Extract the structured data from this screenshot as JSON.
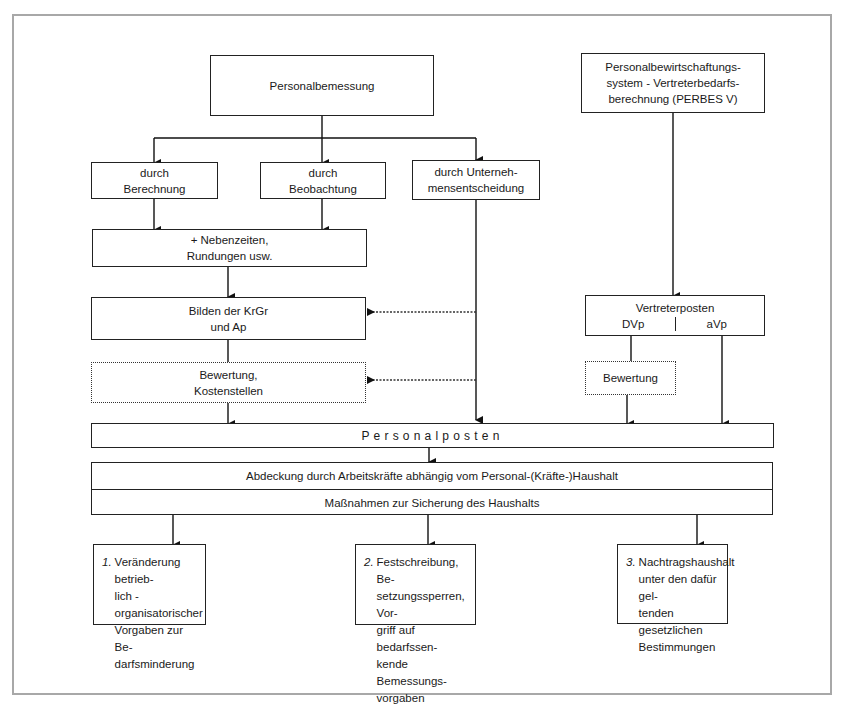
{
  "diagram": {
    "nodes": {
      "personalbemessung": "Personalbemessung",
      "perbes": "Personalbewirtschaftungs-\nsystem - Vertreterbedarfs-\nberechnung (PERBES V)",
      "berechnung": "durch\nBerechnung",
      "beobachtung": "durch\nBeobachtung",
      "unternehmensentscheidung": "durch Unterneh-\nmensentscheidung",
      "nebenzeiten": "+ Nebenzeiten,\nRundungen usw.",
      "bilden": "Bilden der KrGr\nund Ap",
      "bewertung_kosten": "Bewertung,\nKostenstellen",
      "vertreterposten": {
        "title": "Vertreterposten",
        "left": "DVp",
        "right": "aVp"
      },
      "bewertung_vp": "Bewertung",
      "personalposten": "Personalposten",
      "abdeckung": "Abdeckung durch Arbeitskräfte abhängig vom Personal-(Kräfte-)Haushalt",
      "massnahmen": "Maßnahmen zur Sicherung des Haushalts",
      "option1": {
        "num": "1.",
        "text": "Veränderung betrieb-\nlich - organisatorischer\nVorgaben zur Be-\ndarfsminderung"
      },
      "option2": {
        "num": "2.",
        "text": "Festschreibung, Be-\nsetzungssperren, Vor-\ngriff auf bedarfssen-\nkende Bemessungs-\nvorgaben"
      },
      "option3": {
        "num": "3.",
        "text": "Nachtragshaushalt\nunter den dafür gel-\ntenden gesetzlichen\nBestimmungen"
      }
    },
    "edges": [
      {
        "from": "Personalbemessung",
        "to": "durch Berechnung",
        "style": "solid-arrow"
      },
      {
        "from": "Personalbemessung",
        "to": "durch Beobachtung",
        "style": "solid-arrow"
      },
      {
        "from": "Personalbemessung",
        "to": "durch Unternehmensentscheidung",
        "style": "solid-arrow"
      },
      {
        "from": "durch Berechnung",
        "to": "+ Nebenzeiten, Rundungen usw.",
        "style": "solid-arrow"
      },
      {
        "from": "durch Beobachtung",
        "to": "+ Nebenzeiten, Rundungen usw.",
        "style": "solid-arrow"
      },
      {
        "from": "+ Nebenzeiten, Rundungen usw.",
        "to": "Bilden der KrGr und Ap",
        "style": "solid-arrow"
      },
      {
        "from": "Bilden der KrGr und Ap",
        "to": "Bewertung, Kostenstellen",
        "style": "solid-line"
      },
      {
        "from": "durch Unternehmensentscheidung",
        "to": "Bilden der KrGr und Ap",
        "style": "dotted-arrow"
      },
      {
        "from": "durch Unternehmensentscheidung",
        "to": "Bewertung, Kostenstellen",
        "style": "dotted-arrow"
      },
      {
        "from": "durch Unternehmensentscheidung",
        "to": "Personalposten",
        "style": "solid-arrow"
      },
      {
        "from": "Bewertung, Kostenstellen",
        "to": "Personalposten",
        "style": "solid-arrow"
      },
      {
        "from": "PERBES V",
        "to": "Vertreterposten",
        "style": "solid-arrow"
      },
      {
        "from": "DVp",
        "to": "Bewertung",
        "style": "solid-line"
      },
      {
        "from": "Bewertung",
        "to": "Personalposten",
        "style": "solid-arrow"
      },
      {
        "from": "aVp",
        "to": "Personalposten",
        "style": "solid-arrow"
      },
      {
        "from": "Personalposten",
        "to": "Abdeckung durch Arbeitskräfte",
        "style": "solid-arrow"
      },
      {
        "from": "Maßnahmen zur Sicherung des Haushalts",
        "to": "Option 1",
        "style": "solid-arrow"
      },
      {
        "from": "Maßnahmen zur Sicherung des Haushalts",
        "to": "Option 2",
        "style": "solid-arrow"
      },
      {
        "from": "Maßnahmen zur Sicherung des Haushalts",
        "to": "Option 3",
        "style": "solid-arrow"
      }
    ]
  }
}
